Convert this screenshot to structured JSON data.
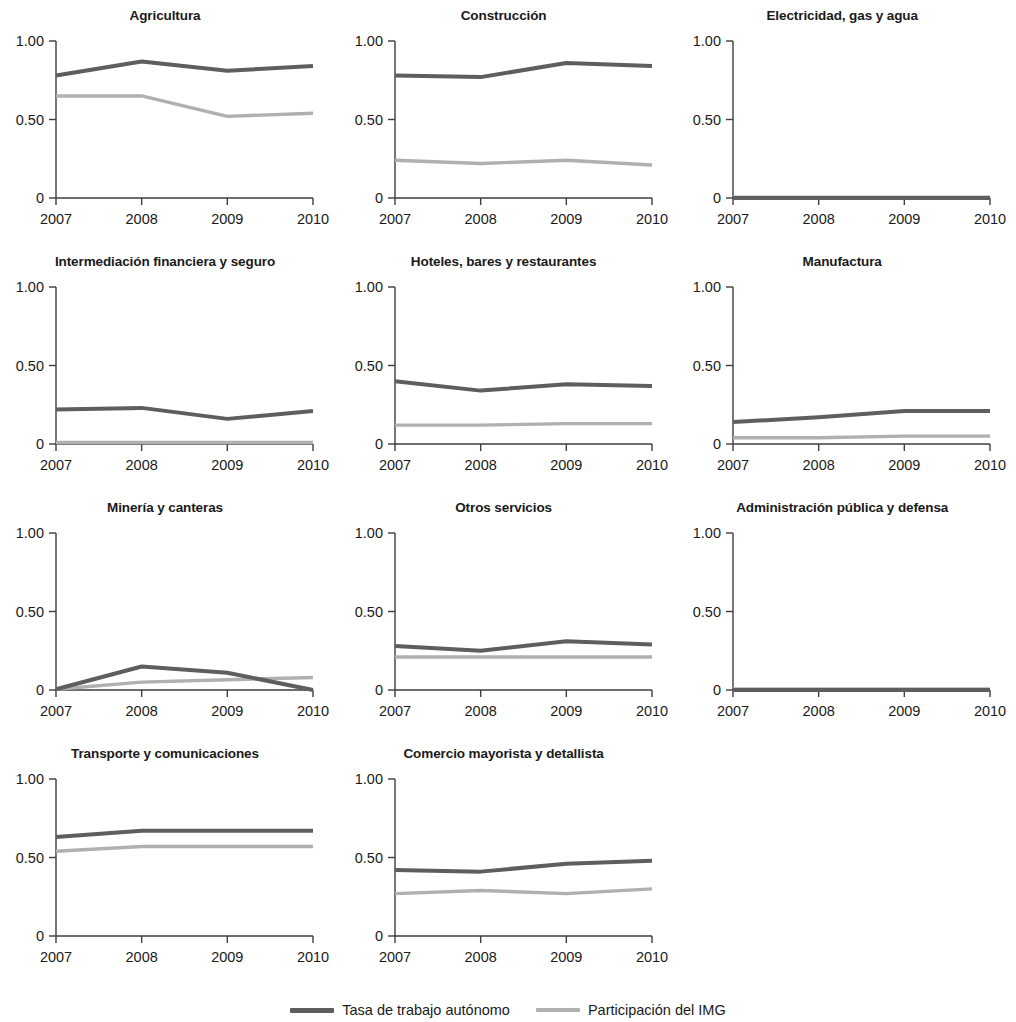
{
  "chart_data": {
    "type": "line",
    "title": "",
    "xlabel": "",
    "ylabel": "",
    "x": [
      2007,
      2008,
      2009,
      2010
    ],
    "xtick_labels": [
      "2007",
      "2008",
      "2009",
      "2010"
    ],
    "ytick_labels": [
      "1.00",
      "0.50",
      "0"
    ],
    "ytick_values": [
      1.0,
      0.5,
      0
    ],
    "ylim": [
      0,
      1.0
    ],
    "xlim": [
      2007,
      2010
    ],
    "grid": false,
    "legend_position": "bottom-center",
    "series_names": [
      "Tasa de trabajo autónomo",
      "Participación del IMG"
    ],
    "series_colors": [
      "#5e5e5e",
      "#b0b0b0"
    ],
    "panels": [
      {
        "title": "Agricultura",
        "series": [
          {
            "name": "Tasa de trabajo autónomo",
            "values": [
              0.78,
              0.87,
              0.81,
              0.84
            ]
          },
          {
            "name": "Participación del IMG",
            "values": [
              0.65,
              0.65,
              0.52,
              0.54
            ]
          }
        ]
      },
      {
        "title": "Construcción",
        "series": [
          {
            "name": "Tasa de trabajo autónomo",
            "values": [
              0.78,
              0.77,
              0.86,
              0.84
            ]
          },
          {
            "name": "Participación del IMG",
            "values": [
              0.24,
              0.22,
              0.24,
              0.21
            ]
          }
        ]
      },
      {
        "title": "Electricidad, gas y agua",
        "series": [
          {
            "name": "Tasa de trabajo autónomo",
            "values": [
              0.0,
              0.0,
              0.0,
              0.0
            ]
          },
          {
            "name": "Participación del IMG",
            "values": [
              0.005,
              0.005,
              0.005,
              0.005
            ]
          }
        ]
      },
      {
        "title": "Intermediación financiera y seguro",
        "series": [
          {
            "name": "Tasa de trabajo autónomo",
            "values": [
              0.22,
              0.23,
              0.16,
              0.21
            ]
          },
          {
            "name": "Participación del IMG",
            "values": [
              0.01,
              0.01,
              0.01,
              0.01
            ]
          }
        ]
      },
      {
        "title": "Hoteles, bares y restaurantes",
        "series": [
          {
            "name": "Tasa de trabajo autónomo",
            "values": [
              0.4,
              0.34,
              0.38,
              0.37
            ]
          },
          {
            "name": "Participación del IMG",
            "values": [
              0.12,
              0.12,
              0.13,
              0.13
            ]
          }
        ]
      },
      {
        "title": "Manufactura",
        "series": [
          {
            "name": "Tasa de trabajo autónomo",
            "values": [
              0.14,
              0.17,
              0.21,
              0.21
            ]
          },
          {
            "name": "Participación del IMG",
            "values": [
              0.04,
              0.04,
              0.05,
              0.05
            ]
          }
        ]
      },
      {
        "title": "Minería y canteras",
        "series": [
          {
            "name": "Tasa de trabajo autónomo",
            "values": [
              0.005,
              0.15,
              0.11,
              0.0
            ]
          },
          {
            "name": "Participación del IMG",
            "values": [
              0.005,
              0.05,
              0.065,
              0.08
            ]
          }
        ]
      },
      {
        "title": "Otros servicios",
        "series": [
          {
            "name": "Tasa de trabajo autónomo",
            "values": [
              0.28,
              0.25,
              0.31,
              0.29
            ]
          },
          {
            "name": "Participación del IMG",
            "values": [
              0.21,
              0.21,
              0.21,
              0.21
            ]
          }
        ]
      },
      {
        "title": "Administración pública y defensa",
        "series": [
          {
            "name": "Tasa de trabajo autónomo",
            "values": [
              0.0,
              0.0,
              0.0,
              0.0
            ]
          },
          {
            "name": "Participación del IMG",
            "values": [
              0.006,
              0.006,
              0.006,
              0.006
            ]
          }
        ]
      },
      {
        "title": "Transporte y comunicaciones",
        "series": [
          {
            "name": "Tasa de trabajo autónomo",
            "values": [
              0.63,
              0.67,
              0.67,
              0.67
            ]
          },
          {
            "name": "Participación del IMG",
            "values": [
              0.54,
              0.57,
              0.57,
              0.57
            ]
          }
        ]
      },
      {
        "title": "Comercio mayorista y detallista",
        "series": [
          {
            "name": "Tasa de trabajo autónomo",
            "values": [
              0.42,
              0.41,
              0.46,
              0.48
            ]
          },
          {
            "name": "Participación del IMG",
            "values": [
              0.27,
              0.29,
              0.27,
              0.3
            ]
          }
        ]
      }
    ]
  },
  "legend": {
    "entries": [
      {
        "label": "Tasa de trabajo autónomo",
        "color": "#5e5e5e"
      },
      {
        "label": "Participación del IMG",
        "color": "#b0b0b0"
      }
    ]
  }
}
